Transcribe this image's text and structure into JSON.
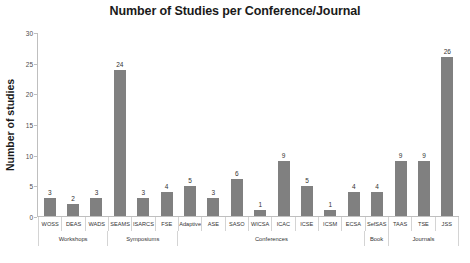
{
  "chart_data": {
    "type": "bar",
    "title": "Number of Studies per Conference/Journal",
    "xlabel": "",
    "ylabel": "Number of studies",
    "ylim": [
      0,
      30
    ],
    "ytick_step": 5,
    "yticks": [
      "0",
      "5",
      "10",
      "15",
      "20",
      "25",
      "30"
    ],
    "grid": false,
    "legend": "none",
    "bar_color": "#808080",
    "show_value_labels": true,
    "categories": [
      "WOSS",
      "DEAS",
      "WADS",
      "SEAMS",
      "ISARCS",
      "FSE",
      "Adaptive",
      "ASE",
      "SASO",
      "WICSA",
      "ICAC",
      "ICSE",
      "ICSM",
      "ECSA",
      "SefSAS",
      "TAAS",
      "TSE",
      "JSS"
    ],
    "values": [
      3,
      2,
      3,
      24,
      3,
      4,
      5,
      3,
      6,
      1,
      9,
      5,
      1,
      4,
      4,
      9,
      9,
      26
    ],
    "groups": [
      {
        "label": "Workshops",
        "span": 3
      },
      {
        "label": "Symposiums",
        "span": 3
      },
      {
        "label": "Conferences",
        "span": 8
      },
      {
        "label": "Book",
        "span": 1
      },
      {
        "label": "Journals",
        "span": 3
      }
    ]
  }
}
